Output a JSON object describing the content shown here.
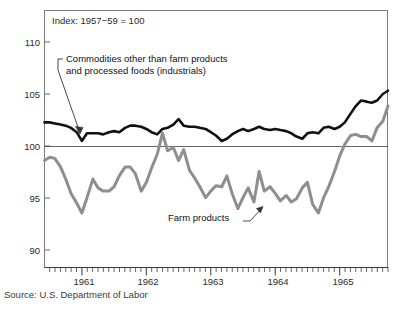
{
  "figure": {
    "background_color": "#ffffff",
    "source_note": "Source: U.S. Department of Labor",
    "index_note": "Index: 1957−59 = 100",
    "annotation_industrials_line1": "Commodities other than farm products",
    "annotation_industrials_line2": "and processed foods (industrials)",
    "annotation_farm": "Farm products"
  },
  "chart_data": {
    "type": "line",
    "title": "",
    "subtitle": "",
    "xlabel": "",
    "ylabel": "",
    "index_base": "Index: 1957−59 = 100",
    "grid": false,
    "legend_position": "inline-annotations",
    "ylim": [
      88.2,
      111.8
    ],
    "yticks": [
      90,
      95,
      100,
      105,
      110
    ],
    "ytick_labels": [
      "90",
      "95",
      "100",
      "105",
      "110"
    ],
    "xlim": [
      1960.42,
      1965.75
    ],
    "xticks": [
      1961,
      1962,
      1963,
      1964,
      1965
    ],
    "xtick_labels": [
      "1961",
      "1962",
      "1963",
      "1964",
      "1965"
    ],
    "minor_xtick_interval_months": 1,
    "reference_line": {
      "y": 100,
      "color": "#555555"
    },
    "series": [
      {
        "name": "Commodities other than farm products and processed foods (industrials)",
        "short_name": "industrials",
        "color": "#111111",
        "linewidth": 2.6,
        "x": [
          1960.42,
          1960.5,
          1960.58,
          1960.67,
          1960.75,
          1960.83,
          1960.92,
          1961.0,
          1961.08,
          1961.17,
          1961.25,
          1961.33,
          1961.42,
          1961.5,
          1961.58,
          1961.67,
          1961.75,
          1961.83,
          1961.92,
          1962.0,
          1962.08,
          1962.17,
          1962.25,
          1962.33,
          1962.42,
          1962.5,
          1962.58,
          1962.67,
          1962.75,
          1962.83,
          1962.92,
          1963.0,
          1963.08,
          1963.17,
          1963.25,
          1963.33,
          1963.42,
          1963.5,
          1963.58,
          1963.67,
          1963.75,
          1963.83,
          1963.92,
          1964.0,
          1964.08,
          1964.17,
          1964.25,
          1964.33,
          1964.42,
          1964.5,
          1964.58,
          1964.67,
          1964.75,
          1964.83,
          1964.92,
          1965.0,
          1965.08,
          1965.17,
          1965.25,
          1965.33,
          1965.42,
          1965.5,
          1965.58,
          1965.67,
          1965.75
        ],
        "values": [
          101.5,
          101.5,
          101.4,
          101.3,
          101.2,
          101.0,
          100.6,
          99.8,
          100.5,
          100.5,
          100.5,
          100.4,
          100.6,
          100.7,
          100.6,
          101.0,
          101.2,
          101.2,
          101.1,
          100.9,
          100.6,
          100.4,
          100.9,
          101.0,
          101.3,
          101.8,
          101.2,
          101.1,
          101.1,
          101.0,
          100.9,
          100.6,
          100.3,
          99.8,
          100.0,
          100.4,
          100.7,
          100.9,
          100.7,
          100.9,
          101.1,
          100.9,
          100.8,
          100.9,
          100.8,
          100.7,
          100.5,
          100.2,
          100.0,
          100.5,
          100.6,
          100.5,
          101.0,
          101.1,
          100.9,
          101.1,
          101.5,
          102.3,
          103.0,
          103.5,
          103.4,
          103.3,
          103.5,
          104.1,
          104.4
        ]
      },
      {
        "name": "Farm products",
        "short_name": "farm",
        "color": "#8e8e8e",
        "linewidth": 3.0,
        "x": [
          1960.42,
          1960.5,
          1960.58,
          1960.67,
          1960.75,
          1960.83,
          1960.92,
          1961.0,
          1961.08,
          1961.17,
          1961.25,
          1961.33,
          1961.42,
          1961.5,
          1961.58,
          1961.67,
          1961.75,
          1961.83,
          1961.92,
          1962.0,
          1962.08,
          1962.17,
          1962.25,
          1962.33,
          1962.42,
          1962.5,
          1962.58,
          1962.67,
          1962.75,
          1962.83,
          1962.92,
          1963.0,
          1963.08,
          1963.17,
          1963.25,
          1963.33,
          1963.42,
          1963.5,
          1963.58,
          1963.67,
          1963.75,
          1963.83,
          1963.92,
          1964.0,
          1964.08,
          1964.17,
          1964.25,
          1964.33,
          1964.42,
          1964.5,
          1964.58,
          1964.67,
          1964.75,
          1964.83,
          1964.92,
          1965.0,
          1965.08,
          1965.17,
          1965.25,
          1965.33,
          1965.42,
          1965.5,
          1965.58,
          1965.67,
          1965.75
        ],
        "values": [
          98.0,
          98.3,
          98.2,
          97.4,
          96.3,
          95.0,
          94.1,
          93.2,
          94.6,
          96.3,
          95.5,
          95.2,
          95.2,
          95.6,
          96.6,
          97.4,
          97.4,
          96.8,
          95.2,
          96.0,
          97.3,
          98.6,
          100.5,
          98.9,
          99.2,
          98.0,
          99.0,
          97.1,
          96.4,
          95.6,
          94.6,
          95.2,
          95.7,
          95.6,
          96.6,
          95.0,
          93.6,
          94.6,
          95.5,
          94.2,
          97.0,
          95.2,
          95.6,
          95.0,
          94.3,
          94.8,
          94.2,
          94.5,
          95.5,
          96.0,
          94.0,
          93.2,
          94.6,
          95.6,
          97.0,
          98.4,
          99.5,
          100.3,
          100.4,
          100.2,
          100.2,
          99.8,
          101.0,
          101.6,
          103.0
        ]
      }
    ],
    "annotations": [
      {
        "text": "Commodities other than farm products and processed foods (industrials)",
        "target_x": 1961.08,
        "target_y": 100.6,
        "style": "leader-line-with-arrow"
      },
      {
        "text": "Farm products",
        "target_x": 1963.45,
        "target_y": 94.6,
        "style": "leader-line-with-arrow"
      },
      {
        "text": "Index: 1957−59 = 100",
        "target_x": null,
        "target_y": null,
        "style": "plain-note"
      }
    ]
  }
}
